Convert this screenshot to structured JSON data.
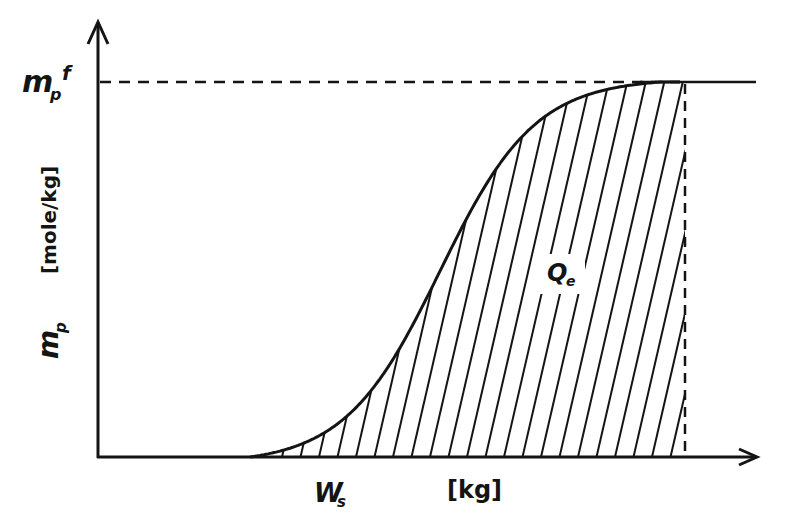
{
  "diagram": {
    "type": "s-curve-area-diagram",
    "y_axis": {
      "label_symbol": "m",
      "label_subscript": "p",
      "unit": "[mole/kg]",
      "top_tick_symbol": "m",
      "top_tick_subscript": "p",
      "top_tick_superscript": "f"
    },
    "x_axis": {
      "unit": "[kg]",
      "marker_symbol": "W",
      "marker_subscript": "s"
    },
    "area_label": {
      "symbol": "Q",
      "subscript": "e"
    },
    "colors": {
      "ink": "#141414",
      "background": "#ffffff"
    }
  }
}
